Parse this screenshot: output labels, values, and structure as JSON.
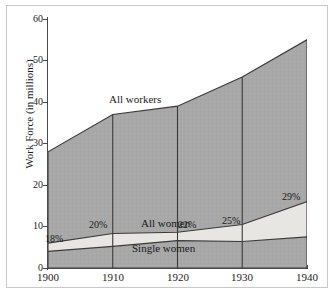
{
  "chart_data": {
    "type": "area",
    "title": "",
    "subtitle": "",
    "xlabel": "",
    "ylabel": "Work Force (in millions)",
    "xlim": [
      1900,
      1940
    ],
    "ylim": [
      0,
      60
    ],
    "grid": false,
    "legend_position": "inline-annotations",
    "x": [
      1900,
      1910,
      1920,
      1930,
      1940
    ],
    "xticklabels": [
      "1900",
      "1910",
      "1920",
      "1930",
      "1940"
    ],
    "yticks": [
      0,
      10,
      20,
      30,
      40,
      50,
      60
    ],
    "yticklabels": [
      "0",
      "10",
      "20",
      "30",
      "40",
      "50",
      "60"
    ],
    "series": [
      {
        "name": "All workers",
        "values": [
          28,
          37,
          39,
          46,
          55
        ]
      },
      {
        "name": "All women",
        "values": [
          6,
          8.3,
          8.6,
          10.5,
          16
        ]
      },
      {
        "name": "Single women",
        "values": [
          4,
          5.2,
          6.6,
          6.4,
          7.5
        ]
      }
    ],
    "annotations": [
      {
        "text": "All workers",
        "x": 1913,
        "y": 41.5
      },
      {
        "text": "All women",
        "x": 1917.5,
        "y": 10.2
      },
      {
        "text": "Single women",
        "x": 1916.5,
        "y": 4.2
      },
      {
        "text": "18%",
        "x": 1900.5,
        "y": 5.2
      },
      {
        "text": "20%",
        "x": 1907.5,
        "y": 10.0
      },
      {
        "text": "22%",
        "x": 1920.3,
        "y": 10.0
      },
      {
        "text": "25%",
        "x": 1926.7,
        "y": 11.6
      },
      {
        "text": "29%",
        "x": 1935.2,
        "y": 17.0
      }
    ],
    "colors": {
      "all_workers_fill": "#a8a8a8",
      "all_women_fill": "#e8e6e2",
      "single_women_fill": "#a8a8a8",
      "outline": "#3a3a3a",
      "axis": "#4a4a4a",
      "text": "#1a1a1a",
      "background": "#ffffff",
      "frame": "#c9c9c9"
    }
  }
}
